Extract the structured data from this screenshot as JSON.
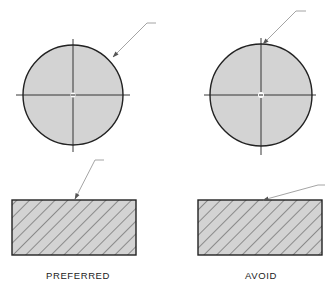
{
  "diagram": {
    "colors": {
      "fill": "#d3d3d3",
      "outline": "#222222",
      "leader": "#9a9a9a",
      "hatch": "#333333"
    },
    "columns": [
      {
        "label": "PREFERRED",
        "circle": {
          "cx": 73,
          "cy": 95,
          "r": 50,
          "leader": {
            "tail": [
              156,
              23
            ],
            "elbow": [
              147,
              23
            ],
            "tip": [
              112,
              58
            ]
          }
        },
        "rect": {
          "x": 12,
          "y": 200,
          "w": 124,
          "h": 55,
          "leader": {
            "tail": [
              104,
              160
            ],
            "elbow": [
              95,
              160
            ],
            "tip": [
              74,
              200
            ]
          }
        }
      },
      {
        "label": "AVOID",
        "circle": {
          "cx": 261,
          "cy": 95,
          "r": 51,
          "leader": {
            "tail": [
              306,
              11
            ],
            "elbow": [
              296,
              11
            ],
            "tip": [
              262,
              45
            ]
          }
        },
        "rect": {
          "x": 198,
          "y": 200,
          "w": 124,
          "h": 55,
          "leader": {
            "tail": [
              325,
              185
            ],
            "elbow": [
              318,
              185
            ],
            "tip": [
              262,
              200
            ]
          }
        }
      }
    ]
  }
}
